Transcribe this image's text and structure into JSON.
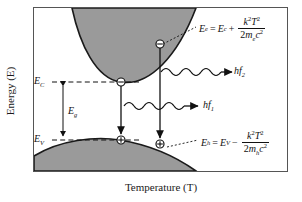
{
  "figure": {
    "type": "diagram",
    "axes": {
      "ylabel": "Energy (E)",
      "xlabel": "Temperature (T)",
      "frame": {
        "left": 33,
        "top": 7,
        "right": 288,
        "bottom": 172
      }
    },
    "energy_levels": [
      {
        "name": "conduction-band-edge",
        "label_main": "E",
        "label_sub": "C",
        "y": 82
      },
      {
        "name": "band-gap",
        "label_main": "E",
        "label_sub": "g",
        "y": 112
      },
      {
        "name": "valence-band-edge",
        "label_main": "E",
        "label_sub": "V",
        "y": 140
      }
    ],
    "equations": {
      "electron": {
        "lhs_main": "E",
        "lhs_sub": "e",
        "eq": "=",
        "term_main": "E",
        "term_sub": "c",
        "op": "+",
        "num_k": "k",
        "num_k_sup": "2",
        "num_T": "T",
        "num_T_sup": "2",
        "den_2": "2",
        "den_m": "m",
        "den_m_sub": "e",
        "den_c": "c",
        "den_c_sup": "2"
      },
      "hole": {
        "lhs_main": "E",
        "lhs_sub": "h",
        "eq": "=",
        "term_main": "E",
        "term_sub": "V",
        "op": "−",
        "num_k": "k",
        "num_k_sup": "2",
        "num_T": "T",
        "num_T_sup": "2",
        "den_2": "2",
        "den_m": "m",
        "den_m_sub": "h",
        "den_c": "c",
        "den_c_sup": "2"
      }
    },
    "photons": [
      {
        "name": "photon-upper",
        "label_main": "hf",
        "label_sub": "2"
      },
      {
        "name": "photon-lower",
        "label_main": "hf",
        "label_sub": "1"
      }
    ],
    "carriers": {
      "electron_glyph": "⊖",
      "hole_glyph": "⊕"
    },
    "colors": {
      "band_fill": "#9a9a9a",
      "band_stroke": "#1a1a1a",
      "frame": "#555555",
      "text": "#111111"
    }
  }
}
